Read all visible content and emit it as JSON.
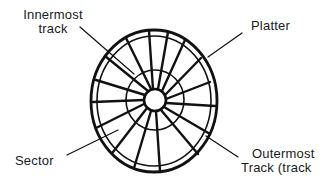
{
  "diagram": {
    "colors": {
      "stroke": "#111111",
      "background": "#ffffff",
      "text": "#1a1a1a"
    },
    "geometry": {
      "center": [
        154,
        101
      ],
      "outer_rx": 63,
      "outer_ry": 71,
      "inner_outer_rx": 57,
      "inner_outer_ry": 65,
      "middle_track_r": 29,
      "hub_r": 11,
      "spoke_count": 16
    },
    "labels": {
      "innermost": {
        "line1": "Innermost",
        "line2": "track"
      },
      "platter": {
        "text": "Platter"
      },
      "sector": {
        "text": "Sector"
      },
      "outermost": {
        "line1": "Outermost",
        "line2": "Track (track"
      }
    },
    "callouts": [
      {
        "target": "innermost-track",
        "from": [
          80,
          27
        ],
        "to": [
          134,
          74
        ]
      },
      {
        "target": "platter",
        "from": [
          242,
          33
        ],
        "to": [
          208,
          57
        ]
      },
      {
        "target": "sector",
        "from": [
          67,
          155
        ],
        "to": [
          118,
          130
        ]
      },
      {
        "target": "outermost-track",
        "from": [
          238,
          157
        ],
        "to": [
          206,
          136
        ]
      }
    ]
  }
}
